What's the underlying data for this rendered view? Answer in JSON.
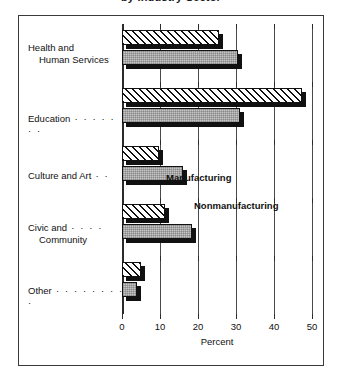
{
  "chart_data": {
    "type": "bar",
    "orientation": "horizontal",
    "title": "by Industry Sector",
    "categories": [
      "Health and Human Services",
      "Education",
      "Culture and Art",
      "Civic and Community",
      "Other"
    ],
    "category_lines": [
      [
        "Health and",
        "Human Services"
      ],
      [
        "Education",
        ""
      ],
      [
        "Culture and Art",
        ""
      ],
      [
        "Civic and",
        "Community"
      ],
      [
        "Other",
        ""
      ]
    ],
    "category_leaders": [
      "",
      " · · · · · · ·",
      " · ·",
      " · · · ·",
      " · · · · · · · · ·"
    ],
    "series": [
      {
        "name": "Manufacturing",
        "values": [
          25.5,
          47.4,
          9.7,
          11.3,
          5.0
        ]
      },
      {
        "name": "Nonmanufacturing",
        "values": [
          30.5,
          31.0,
          16.0,
          18.4,
          4.0
        ]
      }
    ],
    "xlabel": "Percent",
    "ylabel": "",
    "xlim": [
      0,
      50
    ],
    "xticks": [
      0,
      10,
      20,
      30,
      40,
      50
    ],
    "xticklabels": [
      "0",
      "10",
      "20",
      "30",
      "40",
      "50"
    ],
    "grid": true,
    "grid_axis": "x",
    "legend_position": "inside-plot",
    "colors": {
      "manufacturing_fill": "#ffffff",
      "manufacturing_hatch": "#111111",
      "nonmanufacturing_fill": "#c4c4c4",
      "outline": "#111111",
      "shadow": "#111111",
      "axis": "#2b2b2b",
      "frame": "#3a3a3a",
      "background": "#ffffff",
      "text": "#111111"
    }
  }
}
